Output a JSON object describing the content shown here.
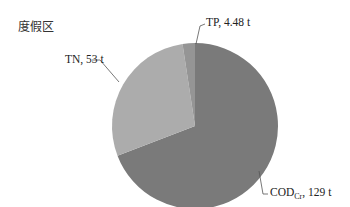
{
  "title": "度假区",
  "labels": {
    "tp": "TP, 4.48 t",
    "tn": "TN, 53 t",
    "cod_main": "COD",
    "cod_sub": "Cr",
    "cod_value": ", 129 t"
  },
  "chart_data": {
    "type": "pie",
    "title": "度假区",
    "categories": [
      "COD_Cr",
      "TN",
      "TP"
    ],
    "values": [
      129,
      53,
      4.48
    ],
    "unit": "t",
    "labels": [
      "COD_Cr, 129 t",
      "TN, 53 t",
      "TP, 4.48 t"
    ],
    "colors": [
      "#7a7a7a",
      "#acacac",
      "#959595"
    ],
    "start_angle": "12 o'clock, clockwise"
  }
}
